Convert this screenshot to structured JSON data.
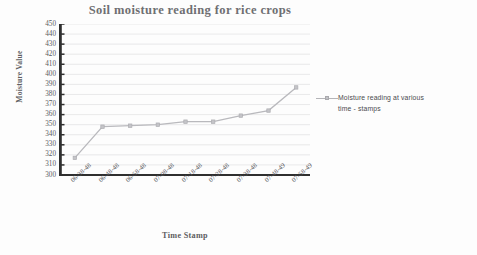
{
  "chart_data": {
    "type": "line",
    "title": "Soil moisture reading for rice crops",
    "xlabel": "Time Stamp",
    "ylabel": "Moisture Value",
    "categories": [
      "06-38-48",
      "06-48-48",
      "06-58-48",
      "07-08-48",
      "07-18-48",
      "07-28-48",
      "07-38-48",
      "07-48-49",
      "07-58-49"
    ],
    "values": [
      317,
      348,
      349,
      350,
      353,
      353,
      359,
      364,
      387
    ],
    "series": [
      {
        "name": "Moisture reading at various time - stamps",
        "values": [
          317,
          348,
          349,
          350,
          353,
          353,
          359,
          364,
          387
        ]
      }
    ],
    "ylim": [
      300,
      450
    ],
    "ytick_step": 10,
    "yticks": [
      300,
      310,
      320,
      330,
      340,
      350,
      360,
      370,
      380,
      390,
      400,
      410,
      420,
      430,
      440,
      450
    ],
    "grid": "horizontal",
    "legend_position": "right",
    "legend_entries": [
      "Moisture reading at various time - stamps"
    ],
    "line_color": "#b9b9bd",
    "marker": "square",
    "axis_color": "#2f2f2f",
    "gridline_color": "#e3e3e5",
    "text_color": "#5a5a5d",
    "title_color": "#6f6f72"
  },
  "legend": {
    "line1": "Moisture reading at various",
    "line2": "time - stamps"
  }
}
